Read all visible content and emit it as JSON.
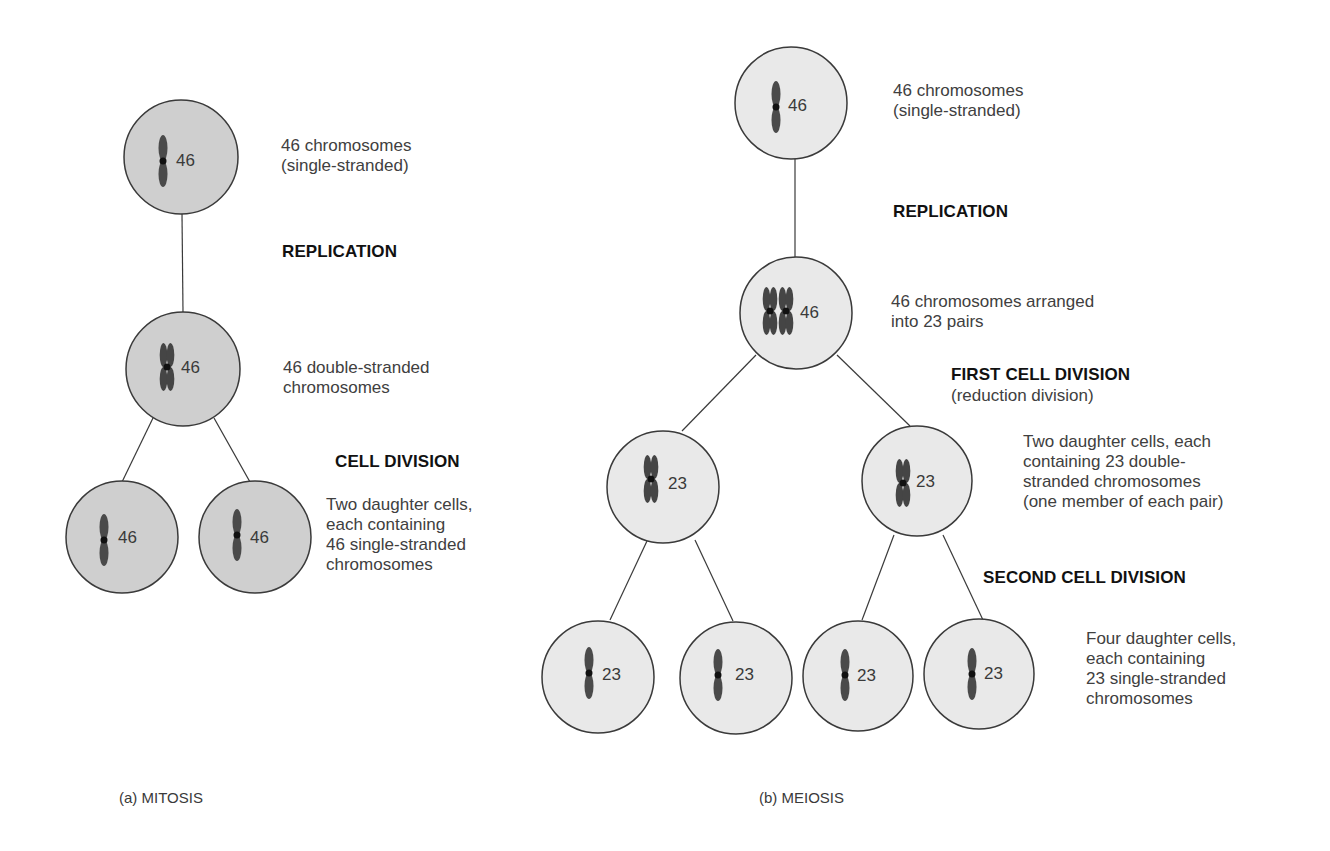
{
  "colors": {
    "mitosis_cell_fill": "#cfcfcf",
    "meiosis_cell_fill": "#e9e9e9",
    "cell_stroke": "#3a3a3a",
    "chromosome": "#4a4a4a",
    "centromere": "#111111"
  },
  "mitosis": {
    "caption": "(a)  MITOSIS",
    "cells": [
      {
        "count": "46",
        "strands": "single"
      },
      {
        "count": "46",
        "strands": "double"
      },
      {
        "count": "46",
        "strands": "single"
      },
      {
        "count": "46",
        "strands": "single"
      }
    ],
    "top_desc": "46 chromosomes\n(single-stranded)",
    "replication_label": "REPLICATION",
    "middle_desc": "46 double-stranded\nchromosomes",
    "division_label": "CELL DIVISION",
    "daughter_desc": "Two daughter cells,\neach containing\n46 single-stranded\nchromosomes"
  },
  "meiosis": {
    "caption": "(b)  MEIOSIS",
    "cells": [
      {
        "count": "46",
        "strands": "single"
      },
      {
        "count": "46",
        "strands": "paired-double"
      },
      {
        "count": "23",
        "strands": "double"
      },
      {
        "count": "23",
        "strands": "double"
      },
      {
        "count": "23",
        "strands": "single"
      },
      {
        "count": "23",
        "strands": "single"
      },
      {
        "count": "23",
        "strands": "single"
      },
      {
        "count": "23",
        "strands": "single"
      }
    ],
    "top_desc": "46 chromosomes\n(single-stranded)",
    "replication_label": "REPLICATION",
    "paired_desc": "46 chromosomes arranged\ninto 23 pairs",
    "first_division_label": "FIRST CELL DIVISION",
    "first_division_sub": "(reduction division)",
    "two_daughter_desc": "Two daughter cells, each\ncontaining 23 double-\nstranded chromosomes\n(one member of each pair)",
    "second_division_label": "SECOND CELL DIVISION",
    "four_daughter_desc": "Four daughter cells,\neach containing\n23 single-stranded\nchromosomes"
  }
}
